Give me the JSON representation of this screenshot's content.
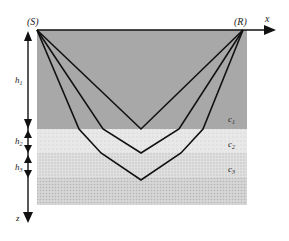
{
  "diagram": {
    "source_label": "(S)",
    "receiver_label": "(R)",
    "x_axis_label": "x",
    "z_axis_label": "z",
    "layers": [
      {
        "id": "c1",
        "label": "c",
        "subscript": "1",
        "thickness_label": "h",
        "thickness_sub": "1",
        "color": "#a8a8a8"
      },
      {
        "id": "c2",
        "label": "c",
        "subscript": "2",
        "thickness_label": "h",
        "thickness_sub": "2",
        "color": "#e6e6e6"
      },
      {
        "id": "c3",
        "label": "c",
        "subscript": "3",
        "thickness_label": "h",
        "thickness_sub": "3",
        "color": "#dcdcdc"
      },
      {
        "id": "c4",
        "label": "",
        "subscript": "",
        "color": "#d2d2d2"
      }
    ],
    "ray_paths": [
      {
        "name": "reflection-layer1",
        "points": [
          [
            37,
            30
          ],
          [
            141,
            129
          ],
          [
            243,
            30
          ]
        ]
      },
      {
        "name": "reflection-layer2",
        "points": [
          [
            37,
            30
          ],
          [
            103,
            129
          ],
          [
            141,
            153
          ],
          [
            179,
            129
          ],
          [
            243,
            30
          ]
        ]
      },
      {
        "name": "reflection-layer3",
        "points": [
          [
            37,
            30
          ],
          [
            79,
            129
          ],
          [
            101,
            153
          ],
          [
            141,
            180
          ],
          [
            181,
            153
          ],
          [
            203,
            129
          ],
          [
            243,
            30
          ]
        ]
      }
    ]
  }
}
